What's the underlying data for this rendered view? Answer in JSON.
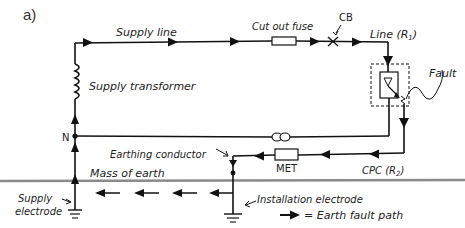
{
  "figure": {
    "panel_label": "a)",
    "labels": {
      "supply_line": "Supply line",
      "cut_out_fuse": "Cut out fuse",
      "cb": "CB",
      "line_r1": "Line (R",
      "line_r1_sub": "1",
      "line_r1_close": ")",
      "fault": "Fault",
      "supply_transformer": "Supply transformer",
      "neutral": "N",
      "earthing_conductor": "Earthing conductor",
      "met": "MET",
      "cpc_r2": "CPC (R",
      "cpc_r2_sub": "2",
      "cpc_r2_close": ")",
      "mass_of_earth": "Mass of earth",
      "supply_electrode_1": "Supply",
      "supply_electrode_2": "electrode",
      "installation_electrode": "Installation electrode",
      "legend_text": "= Earth fault path"
    },
    "colors": {
      "wire": "#111111",
      "ground_line": "#8a8a8a",
      "text": "#222222"
    }
  }
}
